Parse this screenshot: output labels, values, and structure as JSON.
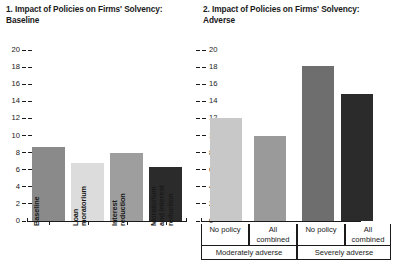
{
  "panels": {
    "left": {
      "title": "1. Impact of Policies on Firms' Solvency:\n    Baseline",
      "axis": {
        "ticks": [
          "0",
          "2",
          "4",
          "6",
          "8",
          "10",
          "12",
          "14",
          "16",
          "18",
          "20"
        ],
        "min": 0,
        "max": 20
      },
      "categories": [
        "Baseline",
        "Loan\nmoratorium",
        "Interest\nreduction",
        "Moratorium\nand interest\nreduction"
      ],
      "values": [
        8.7,
        6.8,
        7.9,
        6.3
      ],
      "colors": [
        "#8a8a8a",
        "#dcdcdc",
        "#9e9e9e",
        "#2b2b2b"
      ]
    },
    "right": {
      "title": "2. Impact of Policies on Firms' Solvency:\n    Adverse",
      "axis": {
        "ticks": [
          "0",
          "2",
          "4",
          "6",
          "8",
          "10",
          "12",
          "14",
          "16",
          "18",
          "20"
        ],
        "min": 0,
        "max": 20
      },
      "categories": [
        "No policy",
        "All\ncombined",
        "No policy",
        "All\ncombined"
      ],
      "groups": [
        "Moderately adverse",
        "Severely adverse"
      ],
      "values": [
        12.1,
        10.0,
        18.1,
        14.8
      ],
      "colors": [
        "#c8c8c8",
        "#9a9a9a",
        "#6e6e6e",
        "#2b2b2b"
      ]
    }
  },
  "chart_data": [
    {
      "type": "bar",
      "title": "1. Impact of Policies on Firms' Solvency: Baseline",
      "categories": [
        "Baseline",
        "Loan moratorium",
        "Interest reduction",
        "Moratorium and interest reduction"
      ],
      "values": [
        8.7,
        6.8,
        7.9,
        6.3
      ],
      "xlabel": "",
      "ylabel": "",
      "ylim": [
        0,
        20
      ],
      "yticks": [
        0,
        2,
        4,
        6,
        8,
        10,
        12,
        14,
        16,
        18,
        20
      ],
      "grid": false,
      "legend": "none"
    },
    {
      "type": "bar",
      "title": "2. Impact of Policies on Firms' Solvency: Adverse",
      "categories": [
        "No policy",
        "All combined",
        "No policy",
        "All combined"
      ],
      "groups": [
        "Moderately adverse",
        "Moderately adverse",
        "Severely adverse",
        "Severely adverse"
      ],
      "values": [
        12.1,
        10.0,
        18.1,
        14.8
      ],
      "xlabel": "",
      "ylabel": "",
      "ylim": [
        0,
        20
      ],
      "yticks": [
        0,
        2,
        4,
        6,
        8,
        10,
        12,
        14,
        16,
        18,
        20
      ],
      "grid": false,
      "legend": "none"
    }
  ]
}
